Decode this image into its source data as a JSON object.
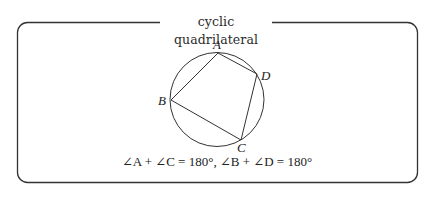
{
  "frame": {
    "title": "cyclic quadrilateral",
    "border_color": "#333333"
  },
  "diagram": {
    "circle": {
      "cx": 217,
      "cy": 99.5,
      "r": 47
    },
    "vertices": {
      "A": {
        "label": "A",
        "x": 218,
        "y": 53
      },
      "B": {
        "label": "B",
        "x": 171,
        "y": 100
      },
      "C": {
        "label": "C",
        "x": 241,
        "y": 140
      },
      "D": {
        "label": "D",
        "x": 257,
        "y": 74
      }
    },
    "edges": [
      [
        "A",
        "B"
      ],
      [
        "B",
        "C"
      ],
      [
        "C",
        "D"
      ],
      [
        "D",
        "A"
      ]
    ],
    "stroke_color": "#333333"
  },
  "formula": {
    "part1": "∠A + ∠C = 180°",
    "separator": ", ",
    "part2": "∠B + ∠D = 180°"
  }
}
